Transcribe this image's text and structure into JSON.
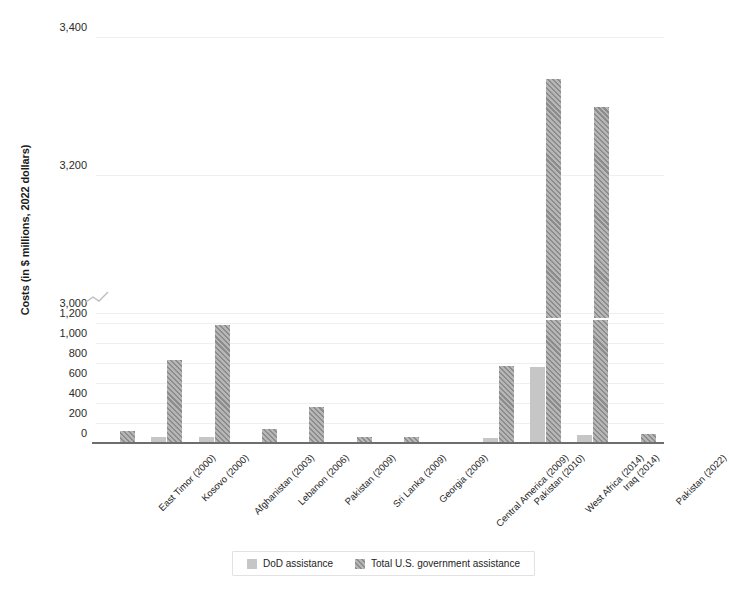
{
  "chart_data": {
    "type": "bar",
    "title": "",
    "xlabel": "",
    "ylabel": "Costs (in $ millions, 2022 dollars)",
    "grid": true,
    "legend_position": "bottom",
    "axis_break": {
      "present": true,
      "lower_max": 1200,
      "upper_min": 3000,
      "note": "y-axis broken between 1,200 and 3,000"
    },
    "ytick_labels": [
      "0",
      "200",
      "400",
      "600",
      "800",
      "1,000",
      "1,200",
      "3,000",
      "3,200",
      "3,400"
    ],
    "ytick_values": [
      0,
      200,
      400,
      600,
      800,
      1000,
      1200,
      3000,
      3200,
      3400
    ],
    "ylim_lower": [
      0,
      1200
    ],
    "ylim_upper": [
      3000,
      3400
    ],
    "categories": [
      "East Timor (2000)",
      "Kosovo (2000)",
      "Afghanistan (2003)",
      "Lebanon (2006)",
      "Pakistan (2009)",
      "Sri Lanka (2009)",
      "Georgia (2009)",
      "Central America (2009)",
      "Pakistan (2010)",
      "West Africa (2014)",
      "Iraq (2014)",
      "Pakistan (2022)"
    ],
    "series": [
      {
        "name": "DoD assistance",
        "color": "#c6c6c6",
        "pattern": "solid",
        "values": [
          0,
          75,
          75,
          3,
          0,
          0,
          20,
          0,
          65,
          770,
          95,
          0
        ]
      },
      {
        "name": "Total U.S. government assistance",
        "color": "#8c8c8c",
        "pattern": "diagonal-hatch",
        "values": [
          135,
          840,
          1190,
          150,
          375,
          75,
          75,
          20,
          785,
          3340,
          3300,
          100
        ]
      }
    ]
  },
  "legend": {
    "items": [
      {
        "label": "DoD assistance"
      },
      {
        "label": "Total U.S. government assistance"
      }
    ]
  }
}
